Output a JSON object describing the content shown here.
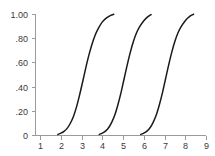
{
  "chart_data": {
    "type": "line",
    "title": "",
    "subtitle": "",
    "xlabel": "",
    "ylabel": "",
    "xlim": [
      0.75,
      9.0
    ],
    "ylim": [
      0.0,
      1.0
    ],
    "grid": false,
    "legend": "none",
    "x_ticks": [
      1,
      2,
      3,
      4,
      5,
      6,
      7,
      8,
      9
    ],
    "x_tick_labels": [
      "1",
      "2",
      "3",
      "4",
      "5",
      "6",
      "7",
      "8",
      "9"
    ],
    "y_ticks": [
      0.0,
      0.2,
      0.4,
      0.6,
      0.8,
      1.0
    ],
    "y_tick_labels": [
      "0",
      ".20",
      ".40",
      ".60",
      ".80",
      "1.00"
    ],
    "annotations": [],
    "series": [
      {
        "name": "curve-1",
        "color": "#1a1a1a",
        "x": [
          1.85,
          2.0,
          2.15,
          2.3,
          2.45,
          2.6,
          2.75,
          2.9,
          3.05,
          3.2,
          3.35,
          3.5,
          3.65,
          3.8,
          4.0,
          4.2,
          4.4,
          4.55
        ],
        "y": [
          0.005,
          0.015,
          0.03,
          0.055,
          0.095,
          0.15,
          0.23,
          0.33,
          0.44,
          0.555,
          0.66,
          0.75,
          0.825,
          0.88,
          0.935,
          0.968,
          0.988,
          0.998
        ]
      },
      {
        "name": "curve-2",
        "color": "#1a1a1a",
        "x": [
          3.85,
          4.0,
          4.15,
          4.3,
          4.45,
          4.6,
          4.75,
          4.9,
          5.05,
          5.2,
          5.35,
          5.5,
          5.65,
          5.8,
          6.0,
          6.2,
          6.35
        ],
        "y": [
          0.005,
          0.015,
          0.032,
          0.06,
          0.105,
          0.165,
          0.25,
          0.35,
          0.465,
          0.58,
          0.685,
          0.775,
          0.845,
          0.895,
          0.945,
          0.978,
          0.995
        ]
      },
      {
        "name": "curve-3",
        "color": "#1a1a1a",
        "x": [
          5.85,
          6.0,
          6.15,
          6.3,
          6.45,
          6.6,
          6.75,
          6.9,
          7.05,
          7.2,
          7.35,
          7.5,
          7.65,
          7.8,
          8.0,
          8.2,
          8.4
        ],
        "y": [
          0.005,
          0.015,
          0.032,
          0.06,
          0.105,
          0.165,
          0.25,
          0.35,
          0.465,
          0.58,
          0.685,
          0.775,
          0.845,
          0.895,
          0.945,
          0.978,
          0.998
        ]
      }
    ]
  },
  "plot_geometry": {
    "left": 35,
    "right": 206,
    "top": 14,
    "bottom": 135,
    "tick_length": 4
  }
}
